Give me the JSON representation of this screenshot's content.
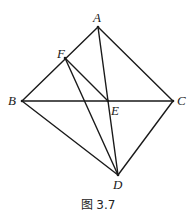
{
  "figure": {
    "caption": "图 3.7",
    "points": {
      "A": {
        "label": "A",
        "x": 98,
        "y": 27
      },
      "B": {
        "label": "B",
        "x": 22,
        "y": 101
      },
      "C": {
        "label": "C",
        "x": 173,
        "y": 101
      },
      "D": {
        "label": "D",
        "x": 118,
        "y": 175
      },
      "E": {
        "label": "E",
        "x": 108,
        "y": 101
      },
      "F": {
        "label": "F",
        "x": 65,
        "y": 58
      }
    },
    "segments": [
      "AB",
      "AC",
      "BC",
      "BD",
      "CD",
      "AD",
      "FE",
      "FD"
    ],
    "line_color": "#1a1a1a"
  }
}
